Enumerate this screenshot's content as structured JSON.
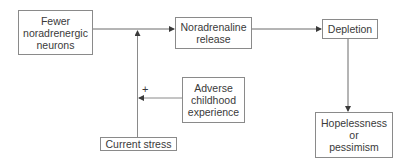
{
  "diagram": {
    "type": "flowchart",
    "nodes": [
      {
        "id": "fewer_neurons",
        "label": "Fewer noradrenergic neurons",
        "lines": [
          "Fewer",
          "noradrenergic",
          "neurons"
        ]
      },
      {
        "id": "noradrenaline_release",
        "label": "Noradrenaline release",
        "lines": [
          "Noradrenaline",
          "release"
        ]
      },
      {
        "id": "depletion",
        "label": "Depletion",
        "lines": [
          "Depletion"
        ]
      },
      {
        "id": "adverse_childhood",
        "label": "Adverse childhood experience",
        "lines": [
          "Adverse",
          "childhood",
          "experience"
        ]
      },
      {
        "id": "current_stress",
        "label": "Current stress",
        "lines": [
          "Current stress"
        ]
      },
      {
        "id": "hopelessness",
        "label": "Hopelessness or pessimism",
        "lines": [
          "Hopelessness",
          "or",
          "pessimism"
        ]
      }
    ],
    "edges": [
      {
        "from": "fewer_neurons",
        "to": "noradrenaline_release",
        "label": ""
      },
      {
        "from": "noradrenaline_release",
        "to": "depletion",
        "label": ""
      },
      {
        "from": "depletion",
        "to": "hopelessness",
        "label": ""
      },
      {
        "from": "current_stress",
        "to": "fewer_neurons->noradrenaline_release",
        "label": ""
      },
      {
        "from": "adverse_childhood",
        "to": "current_stress->main_path",
        "label": "+"
      }
    ],
    "modifier_label": "+"
  }
}
